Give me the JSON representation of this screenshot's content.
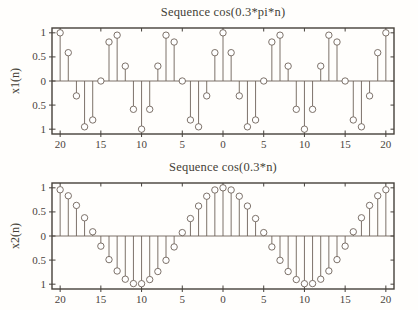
{
  "figure": {
    "background": "#fffefc",
    "colors": {
      "frame": "#46413b",
      "stem": "#6e6259",
      "marker_fill": "#ffffff",
      "text": "#443e37",
      "tick_text": "#4a443c"
    }
  },
  "chart_data": [
    {
      "type": "stem",
      "title": "Sequence cos(0.3*pi*n)",
      "ylabel": "x1(n)",
      "xlabel": "",
      "xlim": [
        -21,
        21
      ],
      "ylim": [
        -1.1,
        1.1
      ],
      "grid": false,
      "legend": "none",
      "xtick_values": [
        -20,
        -15,
        -10,
        -5,
        0,
        5,
        10,
        15,
        20
      ],
      "xtick_labels": [
        "20",
        "15",
        "10",
        "5",
        "0",
        "5",
        "10",
        "15",
        "20"
      ],
      "ytick_values": [
        1,
        0.5,
        0,
        -0.5,
        -1
      ],
      "ytick_labels": [
        "1",
        "0.5",
        "0",
        "0.5",
        "1"
      ],
      "n": [
        -20,
        -19,
        -18,
        -17,
        -16,
        -15,
        -14,
        -13,
        -12,
        -11,
        -10,
        -9,
        -8,
        -7,
        -6,
        -5,
        -4,
        -3,
        -2,
        -1,
        0,
        1,
        2,
        3,
        4,
        5,
        6,
        7,
        8,
        9,
        10,
        11,
        12,
        13,
        14,
        15,
        16,
        17,
        18,
        19,
        20
      ],
      "values": [
        1,
        0.5878,
        -0.309,
        -0.9511,
        -0.809,
        0,
        0.809,
        0.9511,
        0.309,
        -0.5878,
        -1,
        -0.5878,
        0.309,
        0.9511,
        0.809,
        0,
        -0.809,
        -0.9511,
        -0.309,
        0.5878,
        1,
        0.5878,
        -0.309,
        -0.9511,
        -0.809,
        0,
        0.809,
        0.9511,
        0.309,
        -0.5878,
        -1,
        -0.5878,
        0.309,
        0.9511,
        0.809,
        0,
        -0.809,
        -0.9511,
        -0.309,
        0.5878,
        1
      ]
    },
    {
      "type": "stem",
      "title": "Sequence cos(0.3*n)",
      "ylabel": "x2(n)",
      "xlabel": "",
      "xlim": [
        -21,
        21
      ],
      "ylim": [
        -1.1,
        1.1
      ],
      "grid": false,
      "legend": "none",
      "xtick_values": [
        -20,
        -15,
        -10,
        -5,
        0,
        5,
        10,
        15,
        20
      ],
      "xtick_labels": [
        "20",
        "15",
        "10",
        "5",
        "0",
        "5",
        "10",
        "15",
        "20"
      ],
      "ytick_values": [
        1,
        0.5,
        0,
        -0.5,
        -1
      ],
      "ytick_labels": [
        "1",
        "0.5",
        "0",
        "0.5",
        "1"
      ],
      "n": [
        -20,
        -19,
        -18,
        -17,
        -16,
        -15,
        -14,
        -13,
        -12,
        -11,
        -10,
        -9,
        -8,
        -7,
        -6,
        -5,
        -4,
        -3,
        -2,
        -1,
        0,
        1,
        2,
        3,
        4,
        5,
        6,
        7,
        8,
        9,
        10,
        11,
        12,
        13,
        14,
        15,
        16,
        17,
        18,
        19,
        20
      ],
      "values": [
        0.9602,
        0.8347,
        0.6347,
        0.378,
        0.0875,
        -0.2108,
        -0.4903,
        -0.7259,
        -0.8968,
        -0.9875,
        -0.99,
        -0.9041,
        -0.7374,
        -0.5048,
        -0.2272,
        0.0707,
        0.3624,
        0.6216,
        0.8253,
        0.9553,
        1,
        0.9553,
        0.8253,
        0.6216,
        0.3624,
        0.0707,
        -0.2272,
        -0.5048,
        -0.7374,
        -0.9041,
        -0.99,
        -0.9875,
        -0.8968,
        -0.7259,
        -0.4903,
        -0.2108,
        0.0875,
        0.378,
        0.6347,
        0.8347,
        0.9602
      ]
    }
  ]
}
